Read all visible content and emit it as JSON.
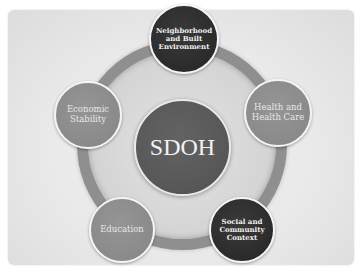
{
  "diagram": {
    "center": {
      "label": "SDOH"
    },
    "nodes": [
      {
        "id": "top",
        "line1": "Neighborhood",
        "line2": "and Built",
        "line3": "Environment",
        "style": "dark"
      },
      {
        "id": "right",
        "line1": "Health and",
        "line2": "Health Care",
        "line3": "",
        "style": "mid"
      },
      {
        "id": "bottom-right",
        "line1": "Social and",
        "line2": "Community",
        "line3": "Context",
        "style": "dark"
      },
      {
        "id": "bottom-left",
        "line1": "Education",
        "line2": "",
        "line3": "",
        "style": "mid"
      },
      {
        "id": "left",
        "line1": "Economic",
        "line2": "Stability",
        "line3": "",
        "style": "mid"
      }
    ]
  },
  "colors": {
    "dark_node": "#2b2b2b",
    "mid_node": "#8a8a8a",
    "center_node": "#575757",
    "ring": "#8f8f8f",
    "panel": "#e9e9e9"
  }
}
